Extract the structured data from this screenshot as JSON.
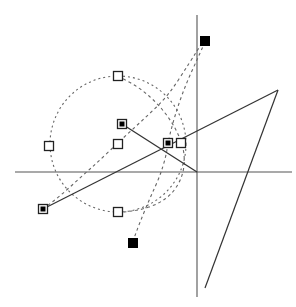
{
  "figure": {
    "title": "",
    "width": 296,
    "height": 307,
    "background_color": "#ffffff"
  },
  "chart_data": {
    "type": "scatter",
    "title": "",
    "xlabel": "",
    "ylabel": "",
    "grid": false,
    "legend": false,
    "axis_color": "#555555",
    "curve_color": "#666666",
    "line_color": "#333333",
    "marker_open_color": "#222222",
    "marker_filled_color": "#000000",
    "axes": {
      "origin": [
        197,
        172
      ],
      "x_axis": {
        "x1": 15,
        "y1": 172,
        "x2": 292,
        "y2": 172
      },
      "y_axis": {
        "x1": 197,
        "y1": 15,
        "x2": 197,
        "y2": 297
      }
    },
    "circle": {
      "center": [
        118,
        144
      ],
      "radius": 68,
      "style": "dotted"
    },
    "dashed_curves": [
      {
        "name": "curve-a",
        "points": [
          [
            43,
            209
          ],
          [
            60,
            196
          ],
          [
            80,
            178
          ],
          [
            100,
            160
          ],
          [
            122,
            139
          ],
          [
            145,
            118
          ],
          [
            168,
            96
          ],
          [
            190,
            62
          ],
          [
            202,
            43
          ]
        ]
      },
      {
        "name": "curve-b",
        "points": [
          [
            205,
            42
          ],
          [
            196,
            62
          ],
          [
            186,
            84
          ],
          [
            178,
            106
          ],
          [
            172,
            126
          ],
          [
            168,
            143
          ],
          [
            166,
            156
          ],
          [
            160,
            176
          ],
          [
            150,
            198
          ],
          [
            140,
            222
          ],
          [
            133,
            241
          ]
        ]
      },
      {
        "name": "curve-c",
        "points": [
          [
            118,
            76
          ],
          [
            140,
            88
          ],
          [
            158,
            104
          ],
          [
            172,
            122
          ],
          [
            182,
            142
          ],
          [
            185,
            160
          ],
          [
            182,
            178
          ],
          [
            172,
            194
          ],
          [
            158,
            204
          ],
          [
            140,
            210
          ],
          [
            124,
            212
          ]
        ]
      }
    ],
    "solid_lines": [
      {
        "name": "line-1",
        "x1": 122,
        "y1": 124,
        "x2": 197,
        "y2": 172
      },
      {
        "name": "line-2",
        "x1": 43,
        "y1": 209,
        "x2": 278,
        "y2": 90
      },
      {
        "name": "line-3",
        "x1": 278,
        "y1": 90,
        "x2": 205,
        "y2": 288
      }
    ],
    "markers": [
      {
        "name": "open-square-circle-top",
        "x": 118,
        "y": 76,
        "fill": "open"
      },
      {
        "name": "open-square-circle-left",
        "x": 49,
        "y": 146,
        "fill": "open"
      },
      {
        "name": "open-square-mid-left",
        "x": 118,
        "y": 144,
        "fill": "open"
      },
      {
        "name": "open-square-circle-bottom",
        "x": 118,
        "y": 212,
        "fill": "open"
      },
      {
        "name": "open-square-right",
        "x": 181,
        "y": 143,
        "fill": "open"
      },
      {
        "name": "crossed-square-upper",
        "x": 122,
        "y": 124,
        "fill": "crossed"
      },
      {
        "name": "crossed-square-center",
        "x": 168,
        "y": 143,
        "fill": "crossed"
      },
      {
        "name": "crossed-square-lower-left",
        "x": 43,
        "y": 209,
        "fill": "crossed"
      },
      {
        "name": "filled-square-top",
        "x": 205,
        "y": 41,
        "fill": "filled"
      },
      {
        "name": "filled-square-bottom",
        "x": 133,
        "y": 243,
        "fill": "filled"
      }
    ],
    "marker_size": 9,
    "xlim": [
      0,
      296
    ],
    "ylim": [
      0,
      307
    ]
  }
}
